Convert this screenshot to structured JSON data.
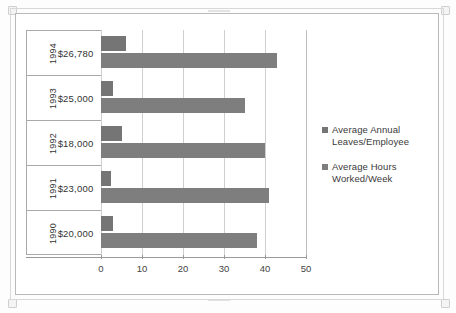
{
  "chart_data": {
    "type": "bar",
    "orientation": "horizontal",
    "title": "",
    "xlabel": "",
    "ylabel": "",
    "xlim": [
      0,
      50
    ],
    "xticks": [
      0,
      10,
      20,
      30,
      40,
      50
    ],
    "xtick_labels": [
      "0",
      "10",
      "20",
      "30",
      "40",
      "50"
    ],
    "grid": true,
    "legend_position": "right",
    "categories": [
      "1994",
      "1993",
      "1992",
      "1991",
      "1990"
    ],
    "category_values": [
      "$26,780",
      "$25,000",
      "$18,000",
      "$23,000",
      "$20,000"
    ],
    "series": [
      {
        "name": "Average Annual Leaves/Employee",
        "color": "#757575",
        "values": [
          6,
          3,
          5,
          2.5,
          3
        ]
      },
      {
        "name": "Average Hours Worked/Week",
        "color": "#7e7e7e",
        "values": [
          43,
          35,
          40,
          41,
          38
        ]
      }
    ],
    "rows": [
      {
        "year": "1994",
        "salary": "$26,780",
        "leaves": 6,
        "hours": 43
      },
      {
        "year": "1993",
        "salary": "$25,000",
        "leaves": 3,
        "hours": 35
      },
      {
        "year": "1992",
        "salary": "$18,000",
        "leaves": 5,
        "hours": 40
      },
      {
        "year": "1991",
        "salary": "$23,000",
        "leaves": 2.5,
        "hours": 41
      },
      {
        "year": "1990",
        "salary": "$20,000",
        "leaves": 3,
        "hours": 38
      }
    ],
    "legend": [
      {
        "label": "Average Annual\nLeaves/Employee",
        "color": "#757575"
      },
      {
        "label": "Average Hours\nWorked/Week",
        "color": "#7e7e7e"
      }
    ]
  },
  "colors": {
    "series_one": "#757575",
    "series_two": "#7e7e7e",
    "axis": "#9a9a9a",
    "grid": "#cfcfcf",
    "frame": "#b9b9b9",
    "background": "#ffffff"
  }
}
